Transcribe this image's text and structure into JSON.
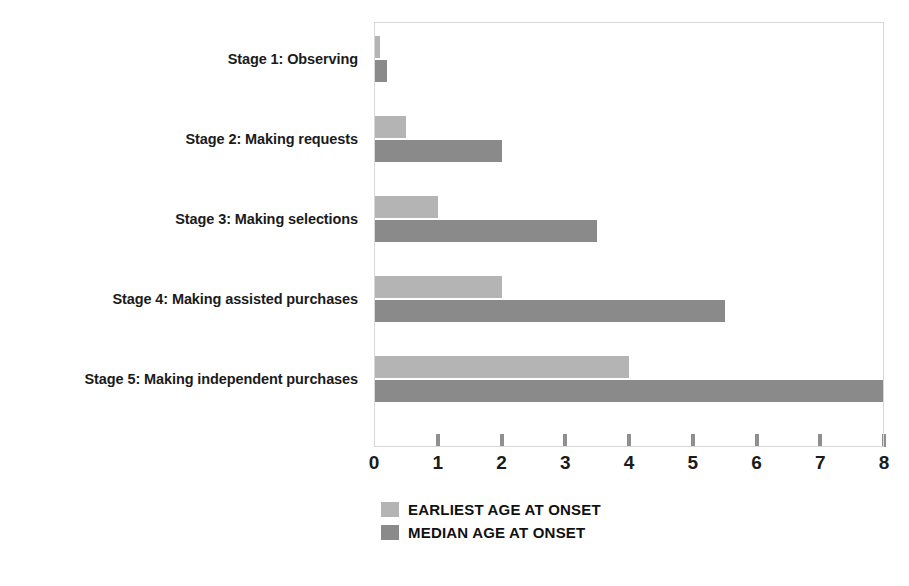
{
  "chart_data": {
    "type": "bar",
    "orientation": "horizontal",
    "title": "",
    "subtitle": "",
    "xlabel": "",
    "ylabel": "",
    "xlim": [
      0,
      8
    ],
    "grid": false,
    "legend_position": "bottom-left",
    "categories": [
      "Stage 1: Observing",
      "Stage 2: Making requests",
      "Stage 3: Making selections",
      "Stage 4: Making assisted purchases",
      "Stage 5: Making independent purchases"
    ],
    "xticks": [
      "0",
      "1",
      "2",
      "3",
      "4",
      "5",
      "6",
      "7",
      "8"
    ],
    "xtick_values": [
      0,
      1,
      2,
      3,
      4,
      5,
      6,
      7,
      8
    ],
    "series": [
      {
        "name": "EARLIEST AGE AT ONSET",
        "color": "#b4b4b4",
        "values": [
          0.1,
          0.5,
          1,
          2,
          4
        ]
      },
      {
        "name": "MEDIAN AGE AT ONSET",
        "color": "#8a8a8a",
        "values": [
          0.2,
          2,
          3.5,
          5.5,
          8
        ]
      }
    ]
  },
  "legend": {
    "items": [
      {
        "label": "EARLIEST AGE AT ONSET",
        "color": "#b4b4b4"
      },
      {
        "label": "MEDIAN AGE AT ONSET",
        "color": "#8a8a8a"
      }
    ]
  }
}
